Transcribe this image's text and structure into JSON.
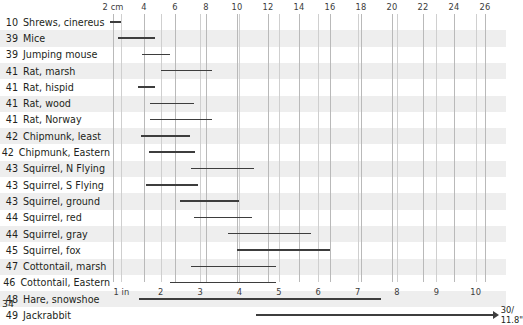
{
  "page": {
    "page_number": "34"
  },
  "chart_data": {
    "type": "bar",
    "title": "",
    "subtitle": "",
    "xlabel_top": "cm",
    "xlabel_bottom": "in",
    "orientation": "horizontal",
    "grid": true,
    "legend": null,
    "axis_top": {
      "unit": "cm",
      "range": [
        0,
        26.5
      ],
      "ticks": [
        {
          "value": 2,
          "label": "2 cm"
        },
        {
          "value": 4,
          "label": "4"
        },
        {
          "value": 6,
          "label": "6"
        },
        {
          "value": 8,
          "label": "8"
        },
        {
          "value": 10,
          "label": "10"
        },
        {
          "value": 12,
          "label": "12"
        },
        {
          "value": 14,
          "label": "14"
        },
        {
          "value": 16,
          "label": "16"
        },
        {
          "value": 18,
          "label": "18"
        },
        {
          "value": 20,
          "label": "20"
        },
        {
          "value": 22,
          "label": "22"
        },
        {
          "value": 24,
          "label": "24"
        },
        {
          "value": 26,
          "label": "26"
        }
      ]
    },
    "axis_bottom": {
      "unit": "in",
      "range": [
        0,
        10.4
      ],
      "ticks": [
        {
          "value": 1,
          "label": "1 in"
        },
        {
          "value": 2,
          "label": "2"
        },
        {
          "value": 3,
          "label": "3"
        },
        {
          "value": 4,
          "label": "4"
        },
        {
          "value": 5,
          "label": "5"
        },
        {
          "value": 6,
          "label": "6"
        },
        {
          "value": 7,
          "label": "7"
        },
        {
          "value": 8,
          "label": "8"
        },
        {
          "value": 9,
          "label": "9"
        },
        {
          "value": 10,
          "label": "10"
        }
      ]
    },
    "categories": [
      {
        "page": "10",
        "name": "Shrews, cinereus",
        "min_cm": 1.8,
        "max_cm": 2.5
      },
      {
        "page": "39",
        "name": "Mice",
        "min_cm": 2.3,
        "max_cm": 4.7
      },
      {
        "page": "39",
        "name": "Jumping mouse",
        "min_cm": 3.9,
        "max_cm": 5.7
      },
      {
        "page": "41",
        "name": "Rat, marsh",
        "min_cm": 5.1,
        "max_cm": 8.4
      },
      {
        "page": "41",
        "name": "Rat, hispid",
        "min_cm": 3.6,
        "max_cm": 4.7
      },
      {
        "page": "41",
        "name": "Rat, wood",
        "min_cm": 4.4,
        "max_cm": 7.2
      },
      {
        "page": "41",
        "name": "Rat, Norway",
        "min_cm": 4.4,
        "max_cm": 8.4
      },
      {
        "page": "42",
        "name": "Chipmunk, least",
        "min_cm": 3.8,
        "max_cm": 7.0
      },
      {
        "page": "42",
        "name": "Chipmunk, Eastern",
        "min_cm": 4.3,
        "max_cm": 7.3
      },
      {
        "page": "43",
        "name": "Squirrel, N Flying",
        "min_cm": 7.0,
        "max_cm": 11.1
      },
      {
        "page": "43",
        "name": "Squirrel, S Flying",
        "min_cm": 4.1,
        "max_cm": 7.5
      },
      {
        "page": "43",
        "name": "Squirrel, ground",
        "min_cm": 6.3,
        "max_cm": 10.1
      },
      {
        "page": "44",
        "name": "Squirrel, red",
        "min_cm": 7.2,
        "max_cm": 11.0
      },
      {
        "page": "44",
        "name": "Squirrel, gray",
        "min_cm": 9.4,
        "max_cm": 14.8
      },
      {
        "page": "45",
        "name": "Squirrel, fox",
        "min_cm": 10.0,
        "max_cm": 16.0
      },
      {
        "page": "47",
        "name": "Cottontail, marsh",
        "min_cm": 7.0,
        "max_cm": 12.5
      },
      {
        "page": "46",
        "name": "Cottontail, Eastern",
        "min_cm": 5.7,
        "max_cm": 12.5
      },
      {
        "page": "48",
        "name": "Hare, snowshoe",
        "min_cm": 3.7,
        "max_cm": 19.3
      },
      {
        "page": "49",
        "name": "Jackrabbit",
        "min_cm": 11.2,
        "max_cm": 26.5,
        "open_ended": true,
        "end_label_line1": "30/",
        "end_label_line2": "11.8\""
      }
    ]
  }
}
